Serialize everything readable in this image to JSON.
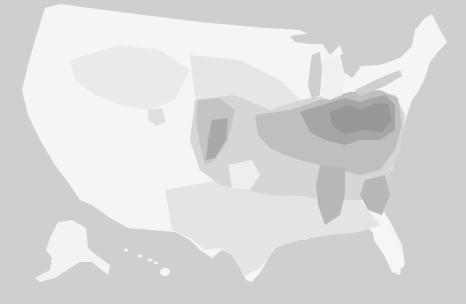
{
  "map": {
    "type": "choropleth",
    "region": "United States (counties)",
    "style": "grayscale",
    "colors": {
      "background": "#cfcfcf",
      "level_0": "#f7f7f7",
      "level_1": "#ececec",
      "level_2": "#dedede",
      "level_3": "#c6c6c6",
      "level_4": "#b0b0b0",
      "level_5": "#9a9a9a"
    },
    "insets": [
      "Alaska",
      "Hawaii"
    ],
    "legend": null,
    "title": null
  }
}
